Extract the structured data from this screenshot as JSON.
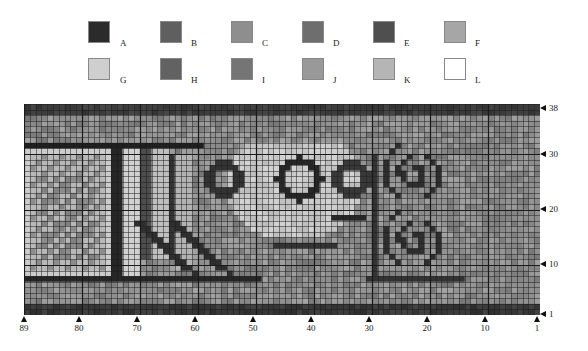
{
  "legend": {
    "swatches": [
      {
        "key": "A",
        "color": "#2b2b2b",
        "x": 88,
        "y": 21,
        "lx": 120,
        "ly": 38
      },
      {
        "key": "B",
        "color": "#5f5f5f",
        "x": 160,
        "y": 21,
        "lx": 191,
        "ly": 38
      },
      {
        "key": "C",
        "color": "#8e8e8e",
        "x": 231,
        "y": 21,
        "lx": 262,
        "ly": 38
      },
      {
        "key": "D",
        "color": "#6e6e6e",
        "x": 302,
        "y": 21,
        "lx": 333,
        "ly": 38
      },
      {
        "key": "E",
        "color": "#4f4f4f",
        "x": 373,
        "y": 21,
        "lx": 404,
        "ly": 38
      },
      {
        "key": "F",
        "color": "#a6a6a6",
        "x": 444,
        "y": 21,
        "lx": 475,
        "ly": 38
      },
      {
        "key": "G",
        "color": "#cfcfcf",
        "x": 88,
        "y": 58,
        "lx": 120,
        "ly": 75
      },
      {
        "key": "H",
        "color": "#626262",
        "x": 160,
        "y": 58,
        "lx": 191,
        "ly": 75
      },
      {
        "key": "I",
        "color": "#757575",
        "x": 231,
        "y": 58,
        "lx": 262,
        "ly": 75
      },
      {
        "key": "J",
        "color": "#999999",
        "x": 302,
        "y": 58,
        "lx": 333,
        "ly": 75
      },
      {
        "key": "K",
        "color": "#b5b5b5",
        "x": 373,
        "y": 58,
        "lx": 404,
        "ly": 75
      },
      {
        "key": "L",
        "color": "#ffffff",
        "x": 444,
        "y": 58,
        "lx": 475,
        "ly": 75
      }
    ]
  },
  "chart": {
    "cols": 89,
    "rows": 38,
    "x_axis": {
      "ticks": [
        {
          "label": "89",
          "x": 24
        },
        {
          "label": "80",
          "x": 79
        },
        {
          "label": "70",
          "x": 137
        },
        {
          "label": "60",
          "x": 195
        },
        {
          "label": "50",
          "x": 253
        },
        {
          "label": "40",
          "x": 311
        },
        {
          "label": "30",
          "x": 369
        },
        {
          "label": "20",
          "x": 427
        },
        {
          "label": "10",
          "x": 485
        },
        {
          "label": "1",
          "x": 537
        }
      ]
    },
    "y_axis": {
      "ticks": [
        {
          "label": "38",
          "y": 107
        },
        {
          "label": "30",
          "y": 153
        },
        {
          "label": "20",
          "y": 208
        },
        {
          "label": "10",
          "y": 263
        },
        {
          "label": "1",
          "y": 313
        }
      ]
    },
    "base_color": "#8a8a8a",
    "grid_color": "#1a1a1a",
    "major_every": 10
  }
}
